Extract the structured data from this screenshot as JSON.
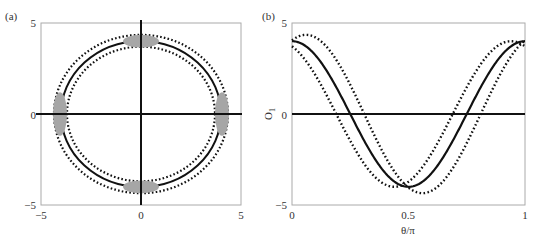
{
  "chart_data": [
    {
      "type": "scatter",
      "panel_label": "(a)",
      "title": "",
      "xlabel": "",
      "ylabel": "",
      "xlim": [
        -5,
        5
      ],
      "ylim": [
        -5,
        5
      ],
      "xticks": [
        "-5",
        "0",
        "5"
      ],
      "yticks": [
        "-5",
        "0",
        "5"
      ],
      "grid": false,
      "axes_lines": [
        {
          "orientation": "horizontal",
          "at": 0
        },
        {
          "orientation": "vertical",
          "at": 0
        }
      ],
      "series": [
        {
          "name": "solid circle",
          "style": "solid",
          "shape": "circle",
          "center": [
            0,
            0
          ],
          "radius": 4.0
        },
        {
          "name": "outer dotted circle",
          "style": "dotted",
          "shape": "circle",
          "center": [
            0,
            0
          ],
          "radius": 4.35
        },
        {
          "name": "inner dotted circle",
          "style": "dotted",
          "shape": "circle",
          "center": [
            0,
            0
          ],
          "radius": 3.7
        },
        {
          "name": "gray regions",
          "style": "filled-gray",
          "shape": "ellipses",
          "items": [
            {
              "cx": 0,
              "cy": 4.0,
              "rx": 0.9,
              "ry": 0.35
            },
            {
              "cx": 0,
              "cy": -4.0,
              "rx": 0.9,
              "ry": 0.35
            },
            {
              "cx": -4.05,
              "cy": 0,
              "rx": 0.35,
              "ry": 1.2
            },
            {
              "cx": 4.05,
              "cy": 0,
              "rx": 0.35,
              "ry": 1.2
            }
          ]
        }
      ]
    },
    {
      "type": "line",
      "panel_label": "(b)",
      "title": "",
      "xlabel": "θ/π",
      "ylabel": "O",
      "ylabel_sub": "1",
      "xlim": [
        0,
        1
      ],
      "ylim": [
        -5,
        5
      ],
      "xticks": [
        "0",
        "0.5",
        "1"
      ],
      "yticks": [
        "-5",
        "0",
        "5"
      ],
      "grid": false,
      "axes_lines": [
        {
          "orientation": "horizontal",
          "at": 0
        }
      ],
      "series": [
        {
          "name": "O1",
          "style": "solid",
          "formula": "4cos(2πx)",
          "amplitude": 4.0,
          "phase": 0.0,
          "offset": 0
        },
        {
          "name": "upper dotted",
          "style": "dotted",
          "formula": "4.35cos(2π(x-0.06))",
          "amplitude": 4.35,
          "phase": 0.06,
          "offset": 0
        },
        {
          "name": "lower dotted",
          "style": "dotted",
          "formula": "3.75cos(2π(x+0.06))... ",
          "amplitude": 4.0,
          "phase": -0.06,
          "offset": 0
        },
        {
          "name": "zero line",
          "style": "solid",
          "formula": "0",
          "amplitude": 0,
          "phase": 0,
          "offset": 0
        }
      ]
    }
  ]
}
